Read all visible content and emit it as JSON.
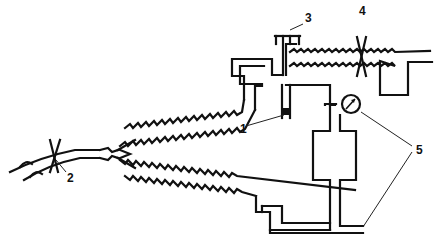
{
  "diagram": {
    "type": "apparatus-schematic",
    "labels": [
      {
        "id": "1",
        "text": "1",
        "x": 243,
        "y": 120
      },
      {
        "id": "2",
        "text": "2",
        "x": 67,
        "y": 175
      },
      {
        "id": "3",
        "text": "3",
        "x": 307,
        "y": 12
      },
      {
        "id": "4",
        "text": "4",
        "x": 361,
        "y": 6
      },
      {
        "id": "5",
        "text": "5",
        "x": 417,
        "y": 143
      }
    ],
    "components": [
      {
        "label": "1",
        "name": "bulb-sensor",
        "description": "small dark-tipped tube hanging from junction"
      },
      {
        "label": "2",
        "name": "clamp-at-inlet",
        "description": "crossed clamp on flexible inlet tube"
      },
      {
        "label": "3",
        "name": "stopcock-valve",
        "description": "T-shaped stopcock at top"
      },
      {
        "label": "4",
        "name": "clamp-on-tubing",
        "description": "crossed clamp on corrugated tubing"
      },
      {
        "label": "5",
        "name": "manometer-and-outlet",
        "description": "pressure gauge and outlet line"
      }
    ],
    "colors": {
      "line": "#111111",
      "background": "#ffffff"
    }
  }
}
